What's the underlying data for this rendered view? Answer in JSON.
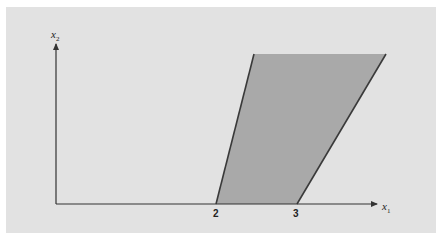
{
  "diagram": {
    "type": "feasible-region",
    "axes": {
      "x": {
        "label": "x",
        "subscript": "1"
      },
      "y": {
        "label": "x",
        "subscript": "2"
      }
    },
    "ticks": [
      {
        "label": "2",
        "x": 2
      },
      {
        "label": "3",
        "x": 3
      }
    ],
    "region": {
      "fill": "#a9a9a9",
      "edge_color": "#3a3a3a",
      "description": "Shaded region bounded below by x1-axis between 2 and 3, with two boundary lines sloping up to the right"
    },
    "colors": {
      "background": "#e2e2e2",
      "axis": "#333333"
    }
  }
}
